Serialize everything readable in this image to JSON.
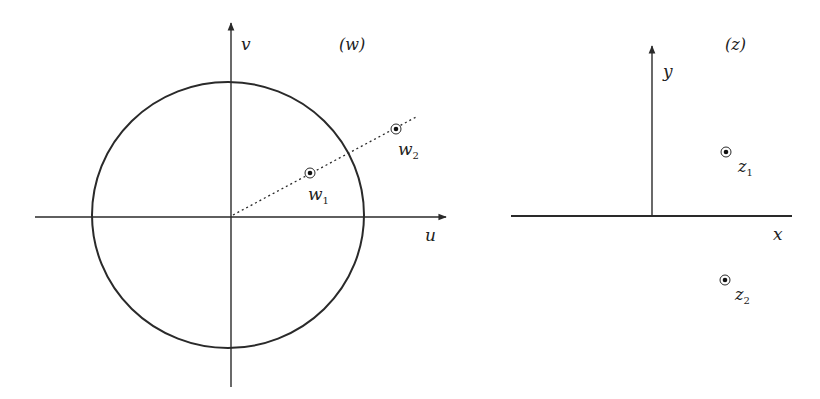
{
  "colors": {
    "ink": "#2a2a2a",
    "background": "#ffffff"
  },
  "w_plane": {
    "title": "(w)",
    "u_axis_label": "u",
    "v_axis_label": "v",
    "unit_circle": true,
    "ray": "dotted line from origin through w1 and w2",
    "points": [
      {
        "name": "w",
        "subscript": "1",
        "position": "inside circle"
      },
      {
        "name": "w",
        "subscript": "2",
        "position": "outside circle"
      }
    ]
  },
  "z_plane": {
    "title": "(z)",
    "x_axis_label": "x",
    "y_axis_label": "y",
    "points": [
      {
        "name": "z",
        "subscript": "1",
        "position": "upper half-plane"
      },
      {
        "name": "z",
        "subscript": "2",
        "position": "lower half-plane"
      }
    ]
  }
}
